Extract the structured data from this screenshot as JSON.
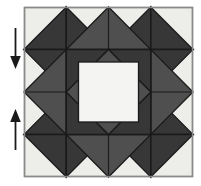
{
  "figure": {
    "kind": "quilt-block-diagram",
    "title": "Quilt block piecing diagram",
    "canvas": {
      "width": 201,
      "height": 186,
      "background": "#ffffff"
    }
  },
  "palette": {
    "background": "#ffffff",
    "light": "#ededea",
    "white": "#f4f4f2",
    "medium_gray": "#4f4f4f",
    "dark_gray": "#373737",
    "outline": "#1a1a1a",
    "border": "#8a8a8a",
    "arrow": "#1a1a1a"
  },
  "block": {
    "label": "quilt-block",
    "x": 24,
    "y": 7,
    "width": 169,
    "height": 170,
    "grid_columns": 4,
    "grid_rows": 4,
    "border_color": "#8a8a8a",
    "fill": "#ededea"
  },
  "annotations": {
    "arrows": [
      {
        "name": "down-arrow",
        "direction": "down",
        "label": "down",
        "x": 15,
        "y_start": 28,
        "y_end": 68,
        "color": "#1a1a1a"
      },
      {
        "name": "up-arrow",
        "direction": "up",
        "label": "up",
        "x": 15,
        "y_start": 150,
        "y_end": 110,
        "color": "#1a1a1a"
      }
    ]
  },
  "shapes": {
    "corner_light_triangles": 4,
    "outer_dark_triangles": 8,
    "medium_corner_squares": 4,
    "medium_edge_triangles": 4,
    "dark_inner_triangles": 8,
    "center_square_color": "#f4f4f2"
  }
}
